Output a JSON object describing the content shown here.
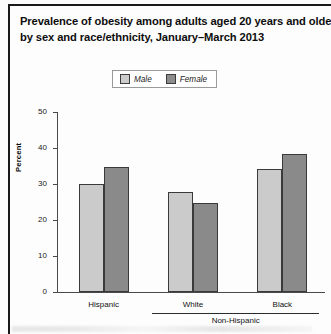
{
  "figure": {
    "title_lines": [
      "Prevalence of obesity among adults aged 20 years and older,",
      "by sex and race/ethnicity, January–March 2013"
    ],
    "legend": {
      "male_label": "Male",
      "female_label": "Female"
    },
    "colors": {
      "male": "#cbcbcb",
      "female": "#8a8a8a",
      "axis": "#4a4a4a",
      "text": "#111111",
      "rule": "#1a1a1a"
    },
    "group_bracket_label": "Non-Hispanic"
  },
  "chart_data": {
    "type": "bar",
    "title": "Prevalence of obesity among adults aged 20 years and older, by sex and race/ethnicity, January–March 2013",
    "xlabel": "",
    "ylabel": "Percent",
    "categories": [
      "Hispanic",
      "White",
      "Black"
    ],
    "category_group_bracket": {
      "label": "Non-Hispanic",
      "spans": [
        "White",
        "Black"
      ]
    },
    "series": [
      {
        "name": "Male",
        "values": [
          30.0,
          27.8,
          34.2
        ]
      },
      {
        "name": "Female",
        "values": [
          34.8,
          24.8,
          38.3
        ]
      }
    ],
    "ylim": [
      0,
      50
    ],
    "yticks": [
      0,
      10,
      20,
      30,
      40,
      50
    ],
    "ytick_labels": [
      "0",
      "10",
      "20",
      "30",
      "40",
      "50"
    ],
    "grid": false,
    "legend_position": "top-center"
  }
}
